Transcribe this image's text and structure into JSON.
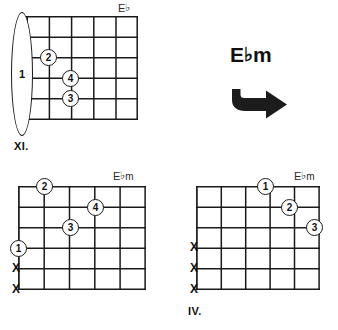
{
  "page": {
    "background_color": "#ffffff",
    "ink_color": "#1a1a1a"
  },
  "caption": {
    "root": "E",
    "accidental": "♭",
    "quality": "m",
    "full_text": "E♭m",
    "arrow_icon": "right-arrow-icon",
    "arrow_direction": "right"
  },
  "diagrams": [
    {
      "id": "diagram-1",
      "label_root": "E",
      "label_accidental": "♭",
      "label_quality": "",
      "label_full": "E♭",
      "position_marker": "XI.",
      "strings": 6,
      "frets": 5,
      "has_nut": true,
      "barre": {
        "finger": "1",
        "from_string": 1,
        "to_string": 6,
        "fret": 0
      },
      "dots": [
        {
          "finger": "2",
          "fret": 1,
          "string": 2
        },
        {
          "finger": "4",
          "fret": 2,
          "string": 3
        },
        {
          "finger": "3",
          "fret": 2,
          "string": 4
        }
      ],
      "muted_strings": []
    },
    {
      "id": "diagram-2",
      "label_root": "E",
      "label_accidental": "♭",
      "label_quality": "m",
      "label_full": "E♭m",
      "position_marker": "",
      "strings": 6,
      "frets": 5,
      "has_nut": false,
      "barre": null,
      "dots": [
        {
          "finger": "2",
          "fret": 1,
          "string": 1
        },
        {
          "finger": "4",
          "fret": 3,
          "string": 2
        },
        {
          "finger": "3",
          "fret": 2,
          "string": 3
        },
        {
          "finger": "1",
          "fret": 0,
          "string": 4
        }
      ],
      "muted_strings": [
        5,
        6
      ]
    },
    {
      "id": "diagram-3",
      "label_root": "E",
      "label_accidental": "♭",
      "label_quality": "m",
      "label_full": "E♭m",
      "position_marker": "IV.",
      "strings": 6,
      "frets": 5,
      "has_nut": false,
      "barre": null,
      "dots": [
        {
          "finger": "1",
          "fret": 3,
          "string": 1
        },
        {
          "finger": "2",
          "fret": 4,
          "string": 2
        },
        {
          "finger": "3",
          "fret": 5,
          "string": 3
        }
      ],
      "muted_strings": [
        4,
        5,
        6
      ]
    }
  ],
  "mute_symbol": "X"
}
